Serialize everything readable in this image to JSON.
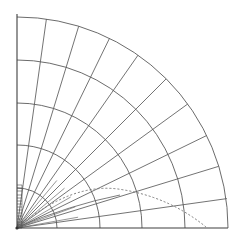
{
  "figure": {
    "title": "",
    "type": "polar-quadrant-grid",
    "background_color": "#ffffff",
    "line_color": "#555555",
    "axis_color": "#444444",
    "dotted_color": "#777777",
    "width": 240,
    "height": 248
  },
  "geometry": {
    "origin": {
      "x": 17,
      "y": 228
    },
    "quadrant": "upper-right",
    "x_axis": {
      "from_x": 17,
      "to_x": 228,
      "y": 228
    },
    "y_axis": {
      "x": 17,
      "from_y": 228,
      "to_y": 14
    }
  },
  "arcs": {
    "label": "concentric range arcs",
    "radii": [
      40,
      83,
      125,
      168,
      211
    ],
    "x_axis_crossings": [
      57,
      100,
      142,
      185,
      228
    ],
    "y_axis_crossings": [
      188,
      145,
      103,
      60,
      17
    ]
  },
  "radials": {
    "label": "radial bearing lines",
    "angles_deg": [
      8,
      17,
      26,
      36,
      45,
      55,
      64,
      73,
      82
    ],
    "outer_radius": 211
  },
  "short_radials": {
    "label": "short radial fan near origin",
    "angles_deg": [
      10,
      20,
      30,
      40,
      50
    ],
    "radius": 62
  },
  "scale_ticks": {
    "label": "vertical tick scale near origin",
    "axis_x": 17,
    "from_y": 228,
    "to_y": 185,
    "count": 14,
    "tick_length": 5
  },
  "dotted_curve": {
    "label": "dotted trajectory curve",
    "style": "dashed",
    "start": {
      "x": 19,
      "y": 226
    },
    "peak": {
      "x": 118,
      "y": 189
    },
    "end": {
      "x": 206,
      "y": 227
    }
  },
  "secondary_curve": {
    "label": "solid low-angle curve",
    "start": {
      "x": 18,
      "y": 227
    },
    "end": {
      "x": 120,
      "y": 195
    }
  }
}
